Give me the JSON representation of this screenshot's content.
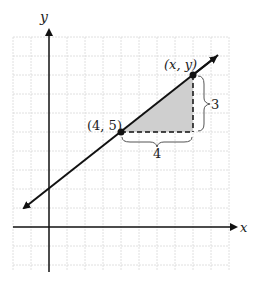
{
  "axes": {
    "x_label": "x",
    "y_label": "y"
  },
  "points": [
    {
      "label": "(4, 5)",
      "x": 4,
      "y": 5
    },
    {
      "label": "(x, y)",
      "x": 8,
      "y": 8
    }
  ],
  "run": {
    "label": "4"
  },
  "rise": {
    "label": "3"
  },
  "colors": {
    "grid": "#d8d8d8",
    "axis": "#111111",
    "fill": "#cfcfcf"
  }
}
